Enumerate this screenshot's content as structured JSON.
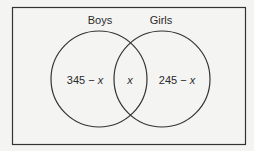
{
  "diagram": {
    "type": "venn",
    "sets": [
      {
        "name": "Boys",
        "label": "Boys",
        "only_region": "345 − x",
        "only_base": "345 − ",
        "only_var": "x"
      },
      {
        "name": "Girls",
        "label": "Girls",
        "only_region": "245 − x",
        "only_base": "245 − ",
        "only_var": "x"
      }
    ],
    "intersection": "x",
    "colors": {
      "stroke": "#333333",
      "background": "#f4f4f2",
      "text": "#2a2a2a"
    }
  }
}
